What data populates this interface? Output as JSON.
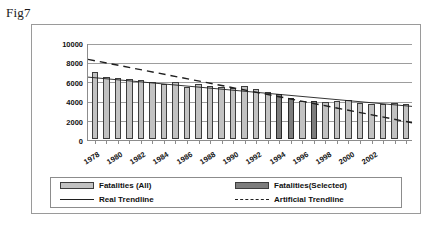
{
  "figure_label": "Fig7",
  "legend": {
    "items": [
      {
        "label": "Fatalities (All)",
        "marker": "bar-light",
        "name": "legend-fatalities-all"
      },
      {
        "label": "Fatalities(Selected)",
        "marker": "bar-dark",
        "name": "legend-fatalities-selected"
      },
      {
        "label": "Real Trendline",
        "marker": "solid-line",
        "name": "legend-real-trendline"
      },
      {
        "label": "Artificial Trendline",
        "marker": "dashed-line",
        "name": "legend-artificial-trendline"
      }
    ]
  },
  "colors": {
    "bar_all": "#c2c2c2",
    "bar_selected": "#7d7d7d",
    "trendline_real": "#1f1f1f",
    "trendline_artificial": "#1f1f1f",
    "gridline": "#9d9d9d",
    "axis": "#8c8c8c",
    "frame": "#9a9a9a"
  },
  "chart_data": {
    "type": "bar",
    "title": "",
    "xlabel": "",
    "ylabel": "",
    "ylim": [
      0,
      10000
    ],
    "ytick_values": [
      0,
      2000,
      4000,
      6000,
      8000,
      10000
    ],
    "ytick_labels": [
      "0",
      "2000",
      "4000",
      "6000",
      "8000",
      "10000"
    ],
    "grid": true,
    "legend_position": "bottom",
    "categories": [
      "1978",
      "1979",
      "1980",
      "1981",
      "1982",
      "1983",
      "1984",
      "1985",
      "1986",
      "1987",
      "1988",
      "1989",
      "1990",
      "1991",
      "1992",
      "1993",
      "1994",
      "1995",
      "1996",
      "1997",
      "1998",
      "1999",
      "2000",
      "2001",
      "2002",
      "2003",
      "2004",
      "2005"
    ],
    "xtick_labels_shown": [
      "1978",
      "1980",
      "1982",
      "1984",
      "1986",
      "1988",
      "1990",
      "1992",
      "1994",
      "1996",
      "1998",
      "2000",
      "2002"
    ],
    "series": [
      {
        "name": "Fatalities (All)",
        "values": [
          7100,
          6500,
          6450,
          6350,
          6200,
          6000,
          5750,
          6000,
          5450,
          5800,
          5600,
          5500,
          5400,
          5600,
          5250,
          4900,
          4700,
          4300,
          4050,
          3950,
          3850,
          4000,
          4100,
          3800,
          3700,
          3650,
          3750,
          3650
        ],
        "selected_flags": [
          false,
          false,
          false,
          false,
          false,
          false,
          false,
          false,
          false,
          false,
          false,
          false,
          false,
          false,
          false,
          false,
          true,
          true,
          false,
          true,
          false,
          false,
          false,
          false,
          false,
          false,
          false,
          false
        ]
      }
    ],
    "trendlines": [
      {
        "name": "Real Trendline",
        "style": "solid",
        "y_start": 6550,
        "y_end": 3500
      },
      {
        "name": "Artificial Trendline",
        "style": "dashed",
        "y_start": 8400,
        "y_end": 1800
      }
    ]
  }
}
